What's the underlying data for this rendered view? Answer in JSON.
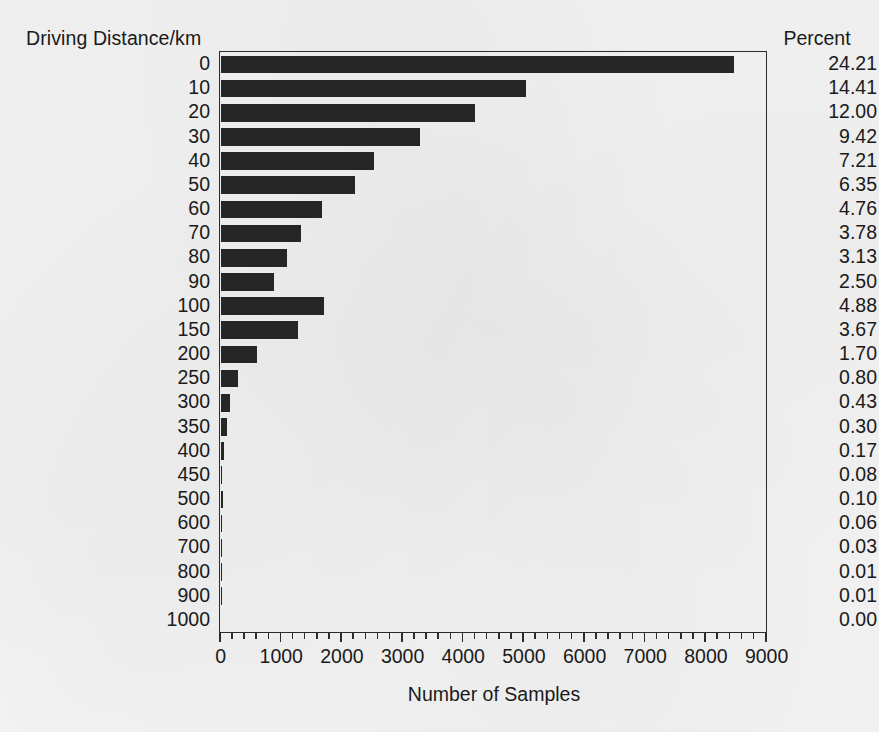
{
  "chart_data": {
    "type": "bar",
    "orientation": "horizontal",
    "title": "",
    "xlabel": "Number of Samples",
    "ylabel": "Driving Distance/km",
    "right_column_header": "Percent",
    "xlim": [
      0,
      9000
    ],
    "xticks": [
      0,
      1000,
      2000,
      3000,
      4000,
      5000,
      6000,
      7000,
      8000,
      9000
    ],
    "xtick_labels": [
      "0",
      "1000",
      "2000",
      "3000",
      "4000",
      "5000",
      "6000",
      "7000",
      "8000",
      "9000"
    ],
    "minor_tick_interval": 200,
    "grid": false,
    "legend": false,
    "bar_color": "#262626",
    "frame_color": "#2b2b2b",
    "categories": [
      "0",
      "10",
      "20",
      "30",
      "40",
      "50",
      "60",
      "70",
      "80",
      "90",
      "100",
      "150",
      "200",
      "250",
      "300",
      "350",
      "400",
      "450",
      "500",
      "600",
      "700",
      "800",
      "900",
      "1000"
    ],
    "values": [
      8470,
      5040,
      4200,
      3295,
      2523,
      2222,
      1665,
      1323,
      1095,
      875,
      1707,
      1284,
      595,
      280,
      150,
      105,
      60,
      28,
      35,
      21,
      10,
      4,
      4,
      0
    ],
    "percents": [
      "24.21",
      "14.41",
      "12.00",
      "9.42",
      "7.21",
      "6.35",
      "4.76",
      "3.78",
      "3.13",
      "2.50",
      "4.88",
      "3.67",
      "1.70",
      "0.80",
      "0.43",
      "0.30",
      "0.17",
      "0.08",
      "0.10",
      "0.06",
      "0.03",
      "0.01",
      "0.01",
      "0.00"
    ]
  },
  "axes": {
    "y_title": "Driving Distance/km",
    "x_title": "Number of Samples",
    "percent_title": "Percent"
  }
}
